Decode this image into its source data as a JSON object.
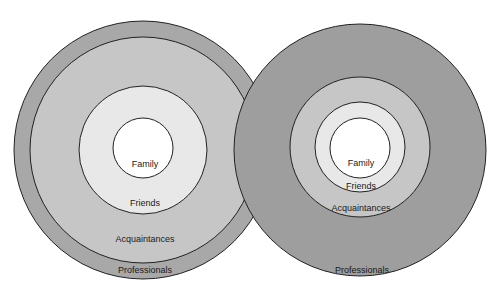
{
  "diagrams": [
    {
      "name": "left",
      "rings": {
        "professionals": {
          "label": "Professionals",
          "cx": 143,
          "cy": 150,
          "r": 129,
          "color": "#a8a8a8"
        },
        "acquaintances": {
          "label": "Acquaintances",
          "cx": 143,
          "cy": 150,
          "r": 113,
          "color": "#c6c6c6"
        },
        "friends": {
          "label": "Friends",
          "cx": 143,
          "cy": 150,
          "r": 64,
          "color": "#e8e8e8"
        },
        "family": {
          "label": "Family",
          "cx": 143,
          "cy": 148,
          "r": 30,
          "color": "#ffffff"
        }
      },
      "label_positions": {
        "family": [
          145,
          165
        ],
        "friends": [
          145,
          204
        ],
        "acquaintances": [
          145,
          240
        ],
        "professionals": [
          145,
          271
        ]
      }
    },
    {
      "name": "right",
      "rings": {
        "professionals": {
          "label": "Professionals",
          "cx": 360,
          "cy": 150,
          "r": 126,
          "color": "#9e9e9e"
        },
        "acquaintances": {
          "label": "Acquaintances",
          "cx": 360,
          "cy": 147,
          "r": 70,
          "color": "#c6c6c6"
        },
        "friends": {
          "label": "Friends",
          "cx": 360,
          "cy": 147,
          "r": 45,
          "color": "#e8e8e8"
        },
        "family": {
          "label": "Family",
          "cx": 360,
          "cy": 148,
          "r": 30,
          "color": "#ffffff"
        }
      },
      "label_positions": {
        "family": [
          361,
          164
        ],
        "friends": [
          361,
          187
        ],
        "acquaintances": [
          361,
          209
        ],
        "professionals": [
          362,
          271
        ]
      }
    }
  ],
  "stroke_color": "#222222"
}
